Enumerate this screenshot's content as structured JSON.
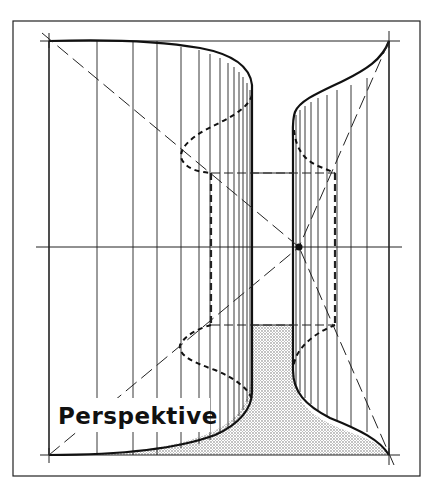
{
  "figure": {
    "label": "Perspektive",
    "colors": {
      "ink": "#111111",
      "background": "#ffffff",
      "stipple": "#555555"
    },
    "elements": [
      "outer-frame",
      "horizon-line",
      "vanishing-point",
      "left-curved-wall",
      "right-curved-wall",
      "inner-back-rectangle",
      "diagonal-construction-lines",
      "stippled-floor",
      "perspektive-label"
    ]
  }
}
